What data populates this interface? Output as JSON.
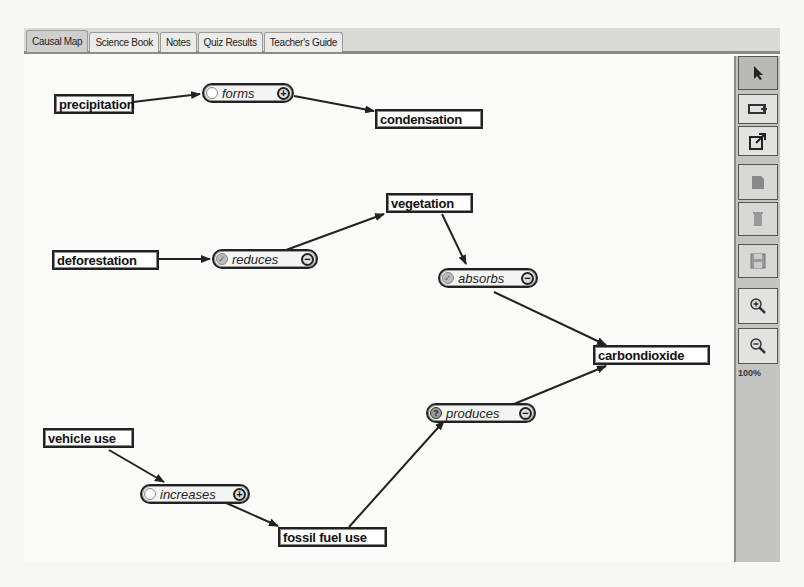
{
  "tabs": [
    {
      "label": "Causal Map",
      "active": true
    },
    {
      "label": "Science Book",
      "active": false
    },
    {
      "label": "Notes",
      "active": false
    },
    {
      "label": "Quiz Results",
      "active": false
    },
    {
      "label": "Teacher's Guide",
      "active": false
    }
  ],
  "toolbar": {
    "buttons": [
      {
        "name": "select-tool",
        "icon": "arrow-pointer-icon",
        "state": "selected"
      },
      {
        "name": "add-concept",
        "icon": "add-concept-icon",
        "state": "enabled"
      },
      {
        "name": "add-link",
        "icon": "add-link-icon",
        "state": "enabled"
      },
      {
        "name": "edit",
        "icon": "edit-icon",
        "state": "disabled"
      },
      {
        "name": "delete",
        "icon": "trash-icon",
        "state": "disabled"
      },
      {
        "name": "save",
        "icon": "floppy-icon",
        "state": "disabled"
      },
      {
        "name": "zoom-in",
        "icon": "zoom-in-icon",
        "state": "enabled"
      },
      {
        "name": "zoom-out",
        "icon": "zoom-out-icon",
        "state": "enabled"
      }
    ],
    "zoom_level": "100%"
  },
  "map": {
    "concepts": [
      {
        "id": "precipitation",
        "label": "precipitation"
      },
      {
        "id": "condensation",
        "label": "condensation"
      },
      {
        "id": "deforestation",
        "label": "deforestation"
      },
      {
        "id": "vegetation",
        "label": "vegetation"
      },
      {
        "id": "carbondioxide",
        "label": "carbondioxide"
      },
      {
        "id": "vehicle_use",
        "label": "vehicle use"
      },
      {
        "id": "fossil_fuel_use",
        "label": "fossil fuel use"
      }
    ],
    "links": [
      {
        "label": "forms",
        "sign": "+",
        "status": "unchecked",
        "from": "precipitation",
        "to": "condensation"
      },
      {
        "label": "reduces",
        "sign": "−",
        "status": "checked",
        "from": "deforestation",
        "to": "vegetation"
      },
      {
        "label": "absorbs",
        "sign": "−",
        "status": "checked",
        "from": "vegetation",
        "to": "carbondioxide"
      },
      {
        "label": "produces",
        "sign": "−",
        "status": "question",
        "from": "fossil_fuel_use",
        "to": "carbondioxide"
      },
      {
        "label": "increases",
        "sign": "+",
        "status": "unchecked",
        "from": "vehicle_use",
        "to": "fossil_fuel_use"
      }
    ],
    "status_glyphs": {
      "unchecked": "",
      "checked": "✓",
      "question": "?"
    }
  }
}
